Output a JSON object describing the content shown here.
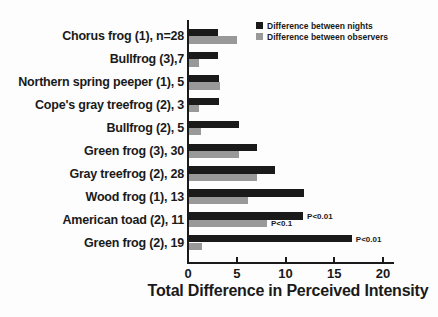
{
  "chart_data": {
    "type": "bar",
    "orientation": "horizontal",
    "xlabel": "Total Difference in Perceived Intensity",
    "ylabel": "",
    "xlim": [
      0,
      20
    ],
    "xticks": [
      0,
      5,
      10,
      15,
      20
    ],
    "grid": false,
    "legend_position": "top-right",
    "categories": [
      "Chorus frog (1), n=28",
      "Bullfrog (3),7",
      "Northern spring peeper (1), 5",
      "Cope's gray treefrog (2), 3",
      "Bullfrog (2), 5",
      "Green frog (3), 30",
      "Gray treefrog (2), 28",
      "Wood frog (1), 13",
      "American toad (2), 11",
      "Green frog (2), 19"
    ],
    "series": [
      {
        "name": "Difference between nights",
        "color": "#1a1a1a",
        "values": [
          3.0,
          3.0,
          3.1,
          3.1,
          5.1,
          7.0,
          8.8,
          11.8,
          11.7,
          16.7
        ],
        "annotations": [
          null,
          null,
          null,
          null,
          null,
          null,
          null,
          null,
          "P<0.01",
          "P<0.01"
        ]
      },
      {
        "name": "Difference between observers",
        "color": "#999999",
        "values": [
          4.9,
          1.0,
          3.2,
          1.0,
          1.2,
          5.1,
          7.0,
          6.0,
          8.0,
          1.3
        ],
        "annotations": [
          null,
          null,
          null,
          null,
          null,
          null,
          null,
          null,
          "P<0.1",
          null
        ]
      }
    ],
    "colors": {
      "background": "#fdfdfd",
      "axis": "#1a1a1a",
      "text": "#1a1a1a"
    }
  }
}
